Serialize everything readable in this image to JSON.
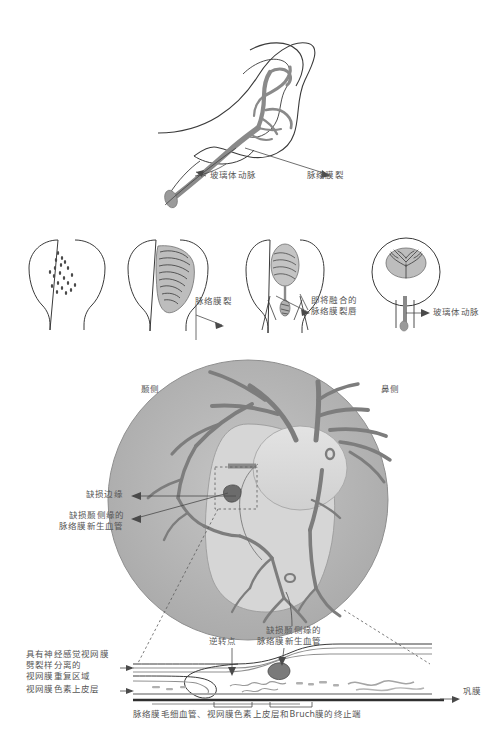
{
  "figure": {
    "title_caption": "",
    "colors": {
      "vessel": "#8a8a8a",
      "vessel_dark": "#6f6f6f",
      "outline": "#3a3a3a",
      "fundus_ring": "#b4b4b4",
      "fundus_inner": "#cfcfcf",
      "disc": "#dcdcdc",
      "label_text": "#565656",
      "leader_line": "#4a4a4a"
    }
  },
  "panel_a": {
    "name": "optic-cup-hyaloid-artery-sagittal",
    "labels": [
      {
        "id": "hyaloid-artery",
        "text": "玻璃体动脉",
        "x": 210,
        "y": 176
      },
      {
        "id": "choroidal-fissure",
        "text": "脉络膜裂",
        "x": 308,
        "y": 176
      }
    ]
  },
  "panel_b": {
    "name": "optic-cup-fissure-closure-series",
    "stages": [
      {
        "id": "stage-1",
        "caption": ""
      },
      {
        "id": "stage-2",
        "caption": ""
      },
      {
        "id": "stage-3",
        "caption": ""
      },
      {
        "id": "stage-4",
        "caption": ""
      }
    ],
    "labels": [
      {
        "id": "choroidal-fissure",
        "text": "脉络膜裂",
        "x": 196,
        "y": 301
      },
      {
        "id": "fusing-fissure-lips-line1",
        "text": "即将融合的",
        "x": 310,
        "y": 300
      },
      {
        "id": "fusing-fissure-lips-line2",
        "text": "脉络膜裂唇",
        "x": 310,
        "y": 310
      },
      {
        "id": "hyaloid-artery",
        "text": "玻璃体动脉",
        "x": 432,
        "y": 312
      }
    ]
  },
  "panel_c": {
    "name": "fundus-coloboma-view",
    "orientation": {
      "temporal": "颞侧",
      "nasal": "鼻侧",
      "temporal_x": 142,
      "temporal_y": 389,
      "nasal_x": 382,
      "nasal_y": 389
    },
    "labels": [
      {
        "id": "coloboma-margin",
        "text": "缺损边缘",
        "x": 85,
        "y": 493
      },
      {
        "id": "cnv-temporal-margin-line1",
        "text": "缺损颞侧缘的",
        "x": 68,
        "y": 514
      },
      {
        "id": "cnv-temporal-margin-line2",
        "text": "脉络膜新生血管",
        "x": 58,
        "y": 525
      },
      {
        "id": "cnv-temporal-margin-bottom-line1",
        "text": "缺损颞侧缘的",
        "x": 267,
        "y": 629
      },
      {
        "id": "cnv-temporal-margin-bottom-line2",
        "text": "脉络膜新生血管",
        "x": 258,
        "y": 640
      }
    ]
  },
  "panel_d": {
    "name": "retina-cross-section",
    "labels": [
      {
        "id": "schisis-retina-duplication-line1",
        "text": "具有神经感觉视网膜",
        "x": 27,
        "y": 653
      },
      {
        "id": "schisis-retina-duplication-line2",
        "text": "劈裂样分离的",
        "x": 27,
        "y": 664
      },
      {
        "id": "schisis-retina-duplication-line3",
        "text": "视网膜重复区域",
        "x": 27,
        "y": 675
      },
      {
        "id": "retinal-pigment-epithelium",
        "text": "视网膜色素上皮层",
        "x": 27,
        "y": 688
      },
      {
        "id": "reversal-point",
        "text": "逆转点",
        "x": 228,
        "y": 640
      },
      {
        "id": "sclera",
        "text": "巩膜",
        "x": 464,
        "y": 690
      },
      {
        "id": "termination-bracket-caption",
        "text": "脉络膜毛细血管、视网膜色素上皮层和Bruch膜的终止端",
        "x": 187,
        "y": 713
      }
    ]
  }
}
